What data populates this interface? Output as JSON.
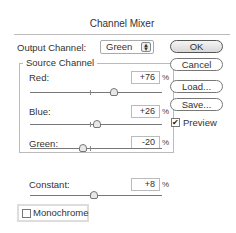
{
  "dialog": {
    "title": "Channel Mixer",
    "output_channel": {
      "label": "Output Channel:",
      "value": "Green",
      "arrows": "▲▼"
    },
    "source_channel": {
      "title": "Source Channel",
      "channels": [
        {
          "label": "Red:",
          "value": "+76",
          "unit": "%"
        },
        {
          "label": "Blue:",
          "value": "+26",
          "unit": "%"
        },
        {
          "label": "Green:",
          "value": "-20",
          "unit": "%"
        }
      ]
    },
    "constant": {
      "label": "Constant:",
      "value": "+8",
      "unit": "%"
    },
    "monochrome": {
      "label": "Monochrome",
      "checked": false
    },
    "buttons": {
      "ok": "OK",
      "cancel": "Cancel",
      "load": "Load...",
      "save": "Save..."
    },
    "preview": {
      "label": "Preview",
      "checked": true,
      "check_glyph": "✔"
    }
  }
}
